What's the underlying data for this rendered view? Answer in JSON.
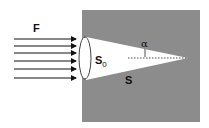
{
  "diagram": {
    "labels": {
      "flux": "F",
      "base_area": "S",
      "base_subscript": "0",
      "lateral_surface": "S",
      "half_angle": "α"
    },
    "colors": {
      "background": "#ffffff",
      "medium": "#8c8c8c",
      "cone": "#ffffff",
      "arrows": "#111111"
    },
    "arrow_count": 6
  }
}
